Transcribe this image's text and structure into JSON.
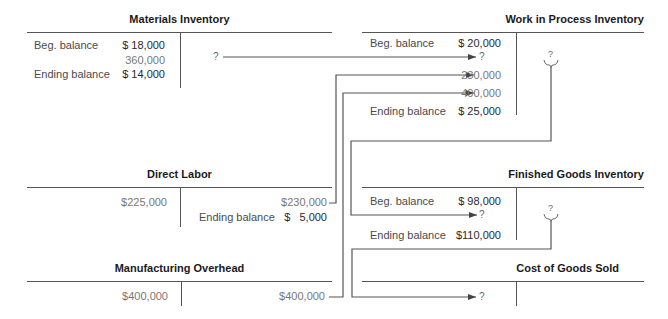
{
  "accounts": {
    "materials_inventory": {
      "title": "Materials Inventory",
      "debit": {
        "beg_label": "Beg. balance",
        "beg_value": "$ 18,000",
        "purchases": "360,000",
        "end_label": "Ending balance",
        "end_value": "$ 14,000"
      },
      "credit": {
        "unknown": "?"
      }
    },
    "work_in_process_inventory": {
      "title": "Work in Process Inventory",
      "debit": {
        "beg_label": "Beg. balance",
        "beg_value": "$ 20,000",
        "materials_in": "?",
        "labor_in": "230,000",
        "overhead_in": "400,000",
        "end_label": "Ending balance",
        "end_value": "$ 25,000"
      },
      "credit": {
        "unknown": "?"
      }
    },
    "direct_labor": {
      "title": "Direct Labor",
      "debit": {
        "value": "$225,000"
      },
      "credit": {
        "transferred": "$230,000",
        "end_label": "Ending balance",
        "end_value": "$   5,000"
      }
    },
    "finished_goods_inventory": {
      "title": "Finished Goods Inventory",
      "debit": {
        "beg_label": "Beg. balance",
        "beg_value": "$ 98,000",
        "cogm_in": "?",
        "end_label": "Ending balance",
        "end_value": "$110,000"
      },
      "credit": {
        "unknown": "?"
      }
    },
    "manufacturing_overhead": {
      "title": "Manufacturing Overhead",
      "debit": {
        "value": "$400,000"
      },
      "credit": {
        "applied": "$400,000"
      }
    },
    "cost_of_goods_sold": {
      "title": "Cost of Goods Sold",
      "debit": {
        "cogs_in": "?"
      }
    }
  },
  "colors": {
    "line": "#555555",
    "title_text": "#1a1a1a",
    "body_text": "#4a4a4a"
  }
}
